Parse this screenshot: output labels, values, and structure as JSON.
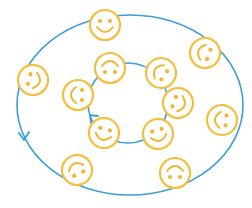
{
  "diagram": {
    "colors": {
      "face_stroke": "#F5BE3C",
      "face_fill": "#ffffff",
      "feature": "#F0B733",
      "ring": "#3A9FD6",
      "background": "#ffffff"
    },
    "outer_ring": {
      "cx": 130,
      "cy": 105,
      "rx": 113,
      "ry": 90,
      "arrow": {
        "x": 24,
        "y": 140,
        "direction": "down"
      }
    },
    "inner_ring": {
      "cx": 128,
      "cy": 103,
      "r": 40,
      "arrow": {
        "x": 92,
        "y": 115,
        "direction": "up-left"
      }
    },
    "outer_faces": [
      {
        "cx": 105,
        "cy": 25,
        "rot": 0
      },
      {
        "cx": 205,
        "cy": 53,
        "rot": 110
      },
      {
        "cx": 33,
        "cy": 80,
        "rot": -75
      },
      {
        "cx": 222,
        "cy": 120,
        "rot": 95
      },
      {
        "cx": 77,
        "cy": 170,
        "rot": 155
      },
      {
        "cx": 175,
        "cy": 173,
        "rot": 180
      }
    ],
    "inner_faces": [
      {
        "cx": 110,
        "cy": 68,
        "rot": 180
      },
      {
        "cx": 161,
        "cy": 73,
        "rot": 125
      },
      {
        "cx": 178,
        "cy": 103,
        "rot": -70
      },
      {
        "cx": 158,
        "cy": 134,
        "rot": -15
      },
      {
        "cx": 104,
        "cy": 133,
        "rot": 15
      },
      {
        "cx": 78,
        "cy": 95,
        "rot": 90
      }
    ],
    "face_radius": 15
  }
}
